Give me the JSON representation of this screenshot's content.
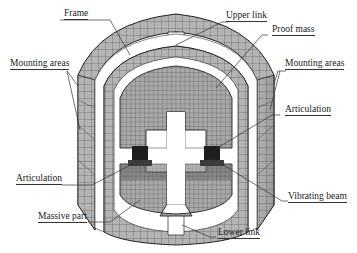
{
  "figure": {
    "colors": {
      "mesh_fill": "#b4b4b4",
      "mesh_fill_dark": "#8c8c8c",
      "mesh_line": "#3a3a3a",
      "beam_fill": "#1e1e1e",
      "gap_fill": "#ffffff",
      "leader_line": "#333333",
      "label_text": "#1a1a1a"
    }
  },
  "labels": {
    "frame": "Frame",
    "upper_link": "Upper link",
    "proof_mass": "Proof mass",
    "mounting_areas_left": "Mounting areas",
    "mounting_areas_right": "Mounting areas",
    "articulation_right": "Articulation",
    "articulation_left": "Articulation",
    "vibrating_beam": "Vibrating beam",
    "massive_part": "Massive part",
    "lower_link": "Lower link"
  }
}
